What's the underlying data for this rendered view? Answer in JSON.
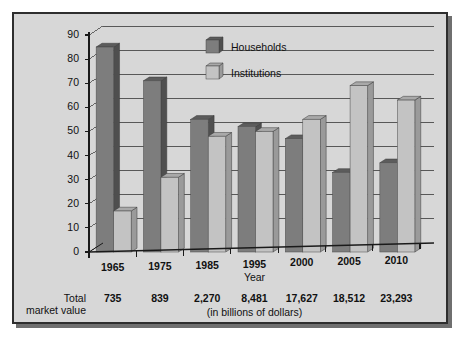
{
  "chart_data": {
    "type": "bar",
    "title": "",
    "subtitle": "",
    "xlabel": "Year",
    "ylabel": "",
    "categories": [
      "1965",
      "1975",
      "1985",
      "1995",
      "2000",
      "2005",
      "2010"
    ],
    "series": [
      {
        "name": "Households",
        "values": [
          85,
          71,
          55,
          52,
          47,
          33,
          37
        ],
        "color": "#7d7d7d"
      },
      {
        "name": "Institutions",
        "values": [
          17,
          31,
          48,
          50,
          55,
          69,
          63
        ],
        "color": "#c3c3c3"
      }
    ],
    "ylim": [
      0,
      90
    ],
    "yticks": [
      "0",
      "10",
      "20",
      "30",
      "40",
      "50",
      "60",
      "70",
      "80",
      "90"
    ],
    "grid": true,
    "legend_position": "top-center"
  },
  "annotations": {
    "total_label_line1": "Total",
    "total_label_line2": "market value",
    "units_note": "(in billions of dollars)",
    "total_market_values": [
      "735",
      "839",
      "2,270",
      "8,481",
      "17,627",
      "18,512",
      "23,293"
    ]
  },
  "colors": {
    "panel_background": "#d7d7d7",
    "frame_border": "#2e2e2e",
    "shadow": "#6f6f6f",
    "gridline": "#4a4a4a",
    "axis": "#1a1a1a",
    "households": "#7d7d7d",
    "households_top": "#5c5c5c",
    "households_side": "#4f4f4f",
    "institutions": "#c3c3c3",
    "institutions_top": "#a9a9a9",
    "institutions_side": "#9a9a9a",
    "text": "#111111"
  }
}
